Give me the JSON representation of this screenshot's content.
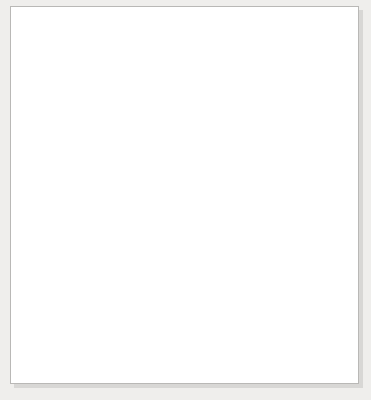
{
  "figure": {
    "title_lines": [
      "Nominal versus Real",
      "Exchange Rates"
    ],
    "y_axis_caption_lines": [
      "U.S. dollar/",
      "British pound",
      "(in log scale)"
    ]
  },
  "chart_data": {
    "type": "line",
    "title": "Nominal versus Real Exchange Rates",
    "xlabel": "",
    "ylabel": "U.S. dollar/British pound (in log scale)",
    "scale": "log",
    "ylim": [
      1,
      10
    ],
    "ytick_labels": [
      "1",
      "10"
    ],
    "ytick_values": [
      1,
      10
    ],
    "grid": false,
    "legend_position": "inline-annotation",
    "xlim": [
      1900,
      2003
    ],
    "xtick_labels": [
      "1900",
      "1906",
      "1912",
      "1918",
      "1924",
      "1930",
      "1936",
      "1942",
      "1948",
      "1954",
      "1960",
      "1966",
      "1972",
      "1978",
      "1984",
      "1990",
      "1996",
      "2003"
    ],
    "xtick_values": [
      1900,
      1906,
      1912,
      1918,
      1924,
      1930,
      1936,
      1942,
      1948,
      1954,
      1960,
      1966,
      1972,
      1978,
      1984,
      1990,
      1996,
      2003
    ],
    "series": [
      {
        "name": "Nominal exchange rate",
        "color": "#111111",
        "label_text": "Nominal exchange rate",
        "x": [
          1900,
          1901,
          1902,
          1903,
          1904,
          1905,
          1906,
          1907,
          1908,
          1909,
          1910,
          1911,
          1912,
          1913,
          1914,
          1915,
          1916,
          1917,
          1918,
          1919,
          1920,
          1921,
          1922,
          1923,
          1924,
          1925,
          1926,
          1927,
          1928,
          1929,
          1930,
          1931,
          1932,
          1933,
          1934,
          1935,
          1936,
          1937,
          1938,
          1939,
          1940,
          1941,
          1942,
          1943,
          1944,
          1945,
          1946,
          1947,
          1948,
          1949,
          1950,
          1951,
          1952,
          1953,
          1954,
          1955,
          1956,
          1957,
          1958,
          1959,
          1960,
          1961,
          1962,
          1963,
          1964,
          1965,
          1966,
          1967,
          1968,
          1969,
          1970,
          1971,
          1972,
          1973,
          1974,
          1975,
          1976,
          1977,
          1978,
          1979,
          1980,
          1981,
          1982,
          1983,
          1984,
          1985,
          1986,
          1987,
          1988,
          1989,
          1990,
          1991,
          1992,
          1993,
          1994,
          1995,
          1996,
          1997,
          1998,
          1999,
          2000,
          2001,
          2002,
          2003
        ],
        "y": [
          4.87,
          4.87,
          4.87,
          4.87,
          4.87,
          4.87,
          4.87,
          4.87,
          4.87,
          4.87,
          4.87,
          4.87,
          4.87,
          4.87,
          4.87,
          4.76,
          4.77,
          4.76,
          4.76,
          4.43,
          3.66,
          3.85,
          4.43,
          4.58,
          4.42,
          4.83,
          4.86,
          4.86,
          4.87,
          4.86,
          4.86,
          4.54,
          3.51,
          4.24,
          5.04,
          4.9,
          4.97,
          4.94,
          4.89,
          4.43,
          3.83,
          4.03,
          4.03,
          4.03,
          4.03,
          4.03,
          4.03,
          4.03,
          4.03,
          3.68,
          2.8,
          2.79,
          2.79,
          2.81,
          2.81,
          2.79,
          2.8,
          2.79,
          2.81,
          2.81,
          2.81,
          2.8,
          2.81,
          2.8,
          2.79,
          2.8,
          2.79,
          2.75,
          2.39,
          2.39,
          2.4,
          2.44,
          2.5,
          2.45,
          2.34,
          2.22,
          1.8,
          1.75,
          1.92,
          2.12,
          2.33,
          2.03,
          1.75,
          1.52,
          1.34,
          1.3,
          1.47,
          1.64,
          1.78,
          1.64,
          1.79,
          1.77,
          1.77,
          1.5,
          1.53,
          1.58,
          1.56,
          1.64,
          1.66,
          1.62,
          1.52,
          1.44,
          1.5,
          1.63
        ]
      },
      {
        "name": "Real exchange rate",
        "color": "#9a9a9a",
        "label_text": "Real exchange rate",
        "x": [
          1900,
          1901,
          1902,
          1903,
          1904,
          1905,
          1906,
          1907,
          1908,
          1909,
          1910,
          1911,
          1912,
          1913,
          1914,
          1915,
          1916,
          1917,
          1918,
          1919,
          1920,
          1921,
          1922,
          1923,
          1924,
          1925,
          1926,
          1927,
          1928,
          1929,
          1930,
          1931,
          1932,
          1933,
          1934,
          1935,
          1936,
          1937,
          1938,
          1939,
          1940,
          1941,
          1942,
          1943,
          1944,
          1945,
          1946,
          1947,
          1948,
          1949,
          1950,
          1951,
          1952,
          1953,
          1954,
          1955,
          1956,
          1957,
          1958,
          1959,
          1960,
          1961,
          1962,
          1963,
          1964,
          1965,
          1966,
          1967,
          1968,
          1969,
          1970,
          1971,
          1972,
          1973,
          1974,
          1975,
          1976,
          1977,
          1978,
          1979,
          1980,
          1981,
          1982,
          1983,
          1984,
          1985,
          1986,
          1987,
          1988,
          1989,
          1990,
          1991,
          1992,
          1993,
          1994,
          1995,
          1996,
          1997,
          1998,
          1999,
          2000,
          2001,
          2002,
          2003
        ],
        "y": [
          4.87,
          4.8,
          4.72,
          4.6,
          4.44,
          4.34,
          4.28,
          4.15,
          4.02,
          3.88,
          3.74,
          3.6,
          3.47,
          3.38,
          3.36,
          3.22,
          3.0,
          2.64,
          2.47,
          2.53,
          2.66,
          3.27,
          3.8,
          4.0,
          3.86,
          4.2,
          4.33,
          4.4,
          4.45,
          4.52,
          4.66,
          4.38,
          3.41,
          3.95,
          4.47,
          4.25,
          4.26,
          4.05,
          3.94,
          3.66,
          3.14,
          2.93,
          2.72,
          2.62,
          2.56,
          2.52,
          2.49,
          2.44,
          2.35,
          2.09,
          1.69,
          1.62,
          1.71,
          1.82,
          1.87,
          1.92,
          1.97,
          2.02,
          2.1,
          2.14,
          2.16,
          2.2,
          2.22,
          2.24,
          2.26,
          2.25,
          2.27,
          2.25,
          2.0,
          2.04,
          2.1,
          2.18,
          2.3,
          2.3,
          2.26,
          2.16,
          1.88,
          1.92,
          2.26,
          2.62,
          3.05,
          2.8,
          2.45,
          2.18,
          1.95,
          1.9,
          2.22,
          2.52,
          2.78,
          2.6,
          2.85,
          2.82,
          2.88,
          2.5,
          2.56,
          2.68,
          2.62,
          2.78,
          2.84,
          2.78,
          2.62,
          2.52,
          2.66,
          2.96
        ]
      }
    ]
  }
}
